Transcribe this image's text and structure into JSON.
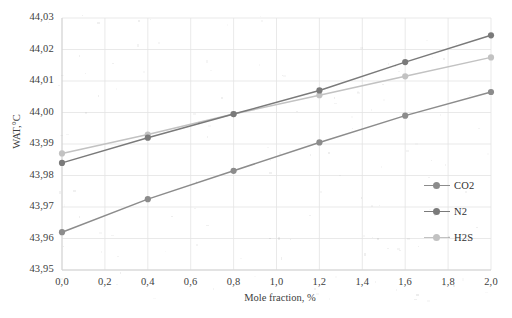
{
  "chart_data": {
    "type": "line",
    "title": "",
    "xlabel": "Mole fraction, %",
    "ylabel": "WAT,°C",
    "x": [
      0.0,
      0.4,
      0.8,
      1.2,
      1.6,
      2.0
    ],
    "xlim": [
      0.0,
      2.0
    ],
    "ylim": [
      43.95,
      44.03
    ],
    "xticks": [
      "0,0",
      "0,2",
      "0,4",
      "0,6",
      "0,8",
      "1,0",
      "1,2",
      "1,4",
      "1,6",
      "1,8",
      "2,0"
    ],
    "xtick_values": [
      0.0,
      0.2,
      0.4,
      0.6,
      0.8,
      1.0,
      1.2,
      1.4,
      1.6,
      1.8,
      2.0
    ],
    "yticks": [
      "43,95",
      "43,96",
      "43,97",
      "43,98",
      "43,99",
      "44,00",
      "44,01",
      "44,02",
      "44,03"
    ],
    "ytick_values": [
      43.95,
      43.96,
      43.97,
      43.98,
      43.99,
      44.0,
      44.01,
      44.02,
      44.03
    ],
    "grid": true,
    "legend_position": "right",
    "series": [
      {
        "name": "CO2",
        "color": "#8c8c8c",
        "values": [
          43.962,
          43.9725,
          43.9815,
          43.9905,
          43.999,
          44.0065
        ]
      },
      {
        "name": "N2",
        "color": "#7a7a7a",
        "values": [
          43.984,
          43.992,
          43.9995,
          44.007,
          44.016,
          44.0245
        ]
      },
      {
        "name": "H2S",
        "color": "#c2c2c2",
        "values": [
          43.987,
          43.993,
          43.9995,
          44.0055,
          44.0115,
          44.0175
        ]
      }
    ]
  },
  "legend": {
    "items": [
      {
        "label": "CO2",
        "color": "#8c8c8c"
      },
      {
        "label": "N2",
        "color": "#7a7a7a"
      },
      {
        "label": "H2S",
        "color": "#c2c2c2"
      }
    ]
  },
  "colors": {
    "grid": "#e3e3e3",
    "axis": "#d2d2d2",
    "text": "#404040",
    "background": "#ffffff"
  }
}
